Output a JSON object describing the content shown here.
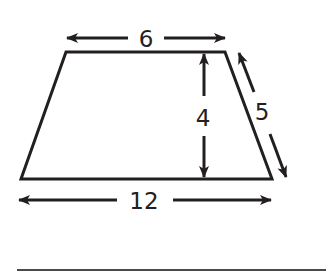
{
  "figure": {
    "shape": "trapezoid",
    "labels": {
      "top_base": "6",
      "height": "4",
      "slant_side": "5",
      "bottom_base": "12"
    },
    "colors": {
      "stroke": "#231f20",
      "background": "#ffffff"
    }
  },
  "answer_line": {
    "visible": true
  }
}
